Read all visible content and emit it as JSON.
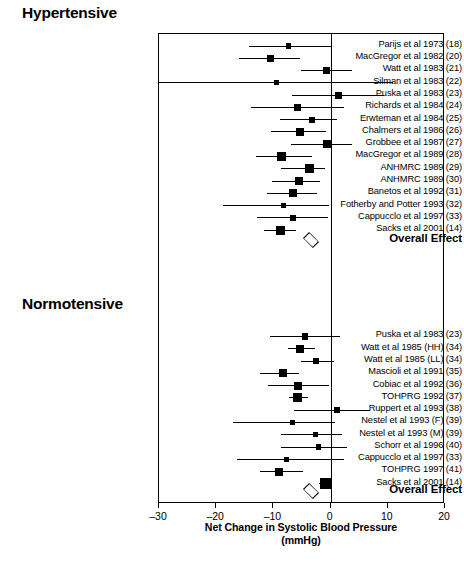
{
  "chart_data": {
    "type": "scatter",
    "plot_style": "forest-plot",
    "title": "",
    "xlabel": "Net Change in Systolic Blood Pressure (mmHg)",
    "xlabel_line1": "Net Change in Systolic Blood Pressure",
    "xlabel_line2": "(mmHg)",
    "ylabel": "",
    "xlim": [
      -30,
      20
    ],
    "xticks": [
      -30,
      -20,
      -10,
      0,
      10,
      20
    ],
    "xticklabels": [
      "–30",
      "–20",
      "–10",
      "0",
      "10",
      "20"
    ],
    "grid": false,
    "reference_line": 0,
    "groups": [
      {
        "name": "Hypertensive",
        "studies": [
          {
            "label": "Parijs et al 1973 (18)",
            "value": -7.3,
            "ci_low": -14.3,
            "ci_high": 0.0,
            "weight": 2
          },
          {
            "label": "MacGregor et al 1982 (20)",
            "value": -10.5,
            "ci_low": -16.0,
            "ci_high": -5.4,
            "weight": 4
          },
          {
            "label": "Watt et al 1983 (21)",
            "value": -0.7,
            "ci_low": -5.1,
            "ci_high": 3.8,
            "weight": 4
          },
          {
            "label": "Silman et al 1983 (22)",
            "value": -9.4,
            "ci_low": -30.0,
            "ci_high": 10.9,
            "weight": 2
          },
          {
            "label": "Puska et al 1983 (23)",
            "value": 1.4,
            "ci_low": -6.8,
            "ci_high": 9.4,
            "weight": 4
          },
          {
            "label": "Richards et al 1984 (24)",
            "value": -5.8,
            "ci_low": -13.9,
            "ci_high": 2.4,
            "weight": 4
          },
          {
            "label": "Erwteman et al 1984 (25)",
            "value": -3.3,
            "ci_low": -8.9,
            "ci_high": 1.2,
            "weight": 3
          },
          {
            "label": "Chalmers et al 1986 (26)",
            "value": -5.4,
            "ci_low": -10.5,
            "ci_high": -0.8,
            "weight": 5
          },
          {
            "label": "Grobbee et al 1987 (27)",
            "value": -0.7,
            "ci_low": -7.0,
            "ci_high": 3.7,
            "weight": 5
          },
          {
            "label": "MacGregor et al 1989 (28)",
            "value": -8.6,
            "ci_low": -13.1,
            "ci_high": -3.3,
            "weight": 6
          },
          {
            "label": "ANHMRC 1989 (29)",
            "value": -3.7,
            "ci_low": -8.6,
            "ci_high": -1.0,
            "weight": 6
          },
          {
            "label": "ANHMRC 1989 (30)",
            "value": -5.6,
            "ci_low": -10.2,
            "ci_high": -1.8,
            "weight": 5
          },
          {
            "label": "Banetos et al 1992 (31)",
            "value": -6.6,
            "ci_low": -11.1,
            "ci_high": -2.4,
            "weight": 5
          },
          {
            "label": "Fotherby and Potter 1993 (32)",
            "value": -8.2,
            "ci_low": -18.8,
            "ci_high": -0.3,
            "weight": 2
          },
          {
            "label": "Cappucclo et al 1997 (33)",
            "value": -6.5,
            "ci_low": -12.8,
            "ci_high": -0.4,
            "weight": 3
          },
          {
            "label": "Sacks et al 2001 (14)",
            "value": -8.7,
            "ci_low": -11.7,
            "ci_high": -6.0,
            "weight": 6
          }
        ],
        "overall": {
          "label": "Overall Effect",
          "value": -3.4,
          "ci_low": -4.6,
          "ci_high": -2.2
        }
      },
      {
        "name": "Normotensive",
        "studies": [
          {
            "label": "Puska et al 1983 (23)",
            "value": -4.4,
            "ci_low": -10.6,
            "ci_high": 1.6,
            "weight": 3
          },
          {
            "label": "Watt et al 1985 (HH) (34)",
            "value": -5.3,
            "ci_low": -7.4,
            "ci_high": -2.8,
            "weight": 5
          },
          {
            "label": "Watt et al 1985 (LL) (34)",
            "value": -2.6,
            "ci_low": -5.1,
            "ci_high": 0.6,
            "weight": 3
          },
          {
            "label": "Mascioli et al 1991 (35)",
            "value": -8.4,
            "ci_low": -12.3,
            "ci_high": -5.5,
            "weight": 5
          },
          {
            "label": "Cobiac et al 1992 (36)",
            "value": -5.7,
            "ci_low": -11.0,
            "ci_high": -0.2,
            "weight": 5
          },
          {
            "label": "TOHPRG 1992 (37)",
            "value": -5.8,
            "ci_low": -7.3,
            "ci_high": -4.0,
            "weight": 6
          },
          {
            "label": "Ruppert et al 1993 (38)",
            "value": 1.2,
            "ci_low": -6.4,
            "ci_high": 6.9,
            "weight": 3
          },
          {
            "label": "Nestel et al 1993 (F) (39)",
            "value": -6.6,
            "ci_low": -17.0,
            "ci_high": 0.7,
            "weight": 2
          },
          {
            "label": "Nestel et al 1993 (M) (39)",
            "value": -2.6,
            "ci_low": -8.7,
            "ci_high": 2.0,
            "weight": 2
          },
          {
            "label": "Schorr et al 1996 (40)",
            "value": -2.1,
            "ci_low": -8.7,
            "ci_high": 2.8,
            "weight": 2
          },
          {
            "label": "Cappucclo et al 1997 (33)",
            "value": -7.7,
            "ci_low": -16.3,
            "ci_high": 2.4,
            "weight": 2
          },
          {
            "label": "TOHPRG 1997 (41)",
            "value": -9.0,
            "ci_low": -12.3,
            "ci_high": -4.9,
            "weight": 5
          },
          {
            "label": "Sacks et al 2001 (14)",
            "value": -0.9,
            "ci_low": -2.0,
            "ci_high": 0.2,
            "weight": 8
          },
          {
            "label": "",
            "value": null,
            "ci_low": null,
            "ci_high": null,
            "weight": 7
          }
        ],
        "overall": {
          "label": "Overall Effect",
          "value": -3.4,
          "ci_low": -4.6,
          "ci_high": -2.2
        }
      }
    ]
  }
}
